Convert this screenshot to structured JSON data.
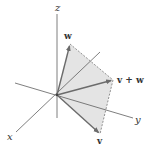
{
  "diagram": {
    "axes": {
      "x": {
        "label": "x"
      },
      "y": {
        "label": "y"
      },
      "z": {
        "label": "z"
      }
    },
    "vectors": {
      "v": {
        "label": "v"
      },
      "w": {
        "label": "w"
      },
      "sum": {
        "label": "v + w"
      }
    },
    "colors": {
      "axis": "#5a5a5a",
      "vector": "#6b6b6b",
      "fill": "#e3e3e3",
      "dashed": "#777777",
      "text": "#333333"
    }
  }
}
